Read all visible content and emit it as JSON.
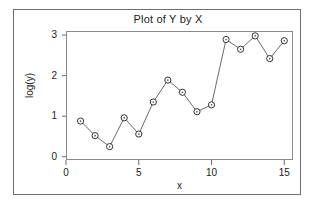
{
  "chart_data": {
    "type": "line",
    "title": "Plot of Y by X",
    "xlabel": "x",
    "ylabel": "log(y)",
    "x": [
      1,
      2,
      3,
      4,
      5,
      6,
      7,
      8,
      9,
      10,
      11,
      12,
      13,
      14,
      15
    ],
    "values": [
      0.88,
      0.52,
      0.25,
      0.96,
      0.56,
      1.35,
      1.89,
      1.59,
      1.11,
      1.28,
      2.89,
      2.65,
      2.98,
      2.42,
      2.86
    ],
    "series": [
      {
        "name": "log(y)",
        "values": [
          0.88,
          0.52,
          0.25,
          0.96,
          0.56,
          1.35,
          1.89,
          1.59,
          1.11,
          1.28,
          2.89,
          2.65,
          2.98,
          2.42,
          2.86
        ]
      }
    ],
    "xlim": [
      0,
      15.6
    ],
    "ylim": [
      -0.08,
      3.1
    ],
    "xticks": [
      0,
      5,
      10,
      15
    ],
    "yticks": [
      0,
      1,
      2,
      3
    ],
    "xtick_labels": [
      "0",
      "5",
      "10",
      "15"
    ],
    "ytick_labels": [
      "0",
      "1",
      "2",
      "3"
    ],
    "grid": false,
    "legend": false,
    "legend_position": "none",
    "marker": "open-circle-with-center-dot",
    "line_color": "#6a6a6a",
    "marker_edge_color": "#303030",
    "marker_face_color": "#ffffff",
    "frame_color": "#8a8a8a",
    "text_color": "#1c1c1c",
    "background_color": "#ffffff"
  },
  "figure": {
    "border_color": "#6e6e6e"
  }
}
